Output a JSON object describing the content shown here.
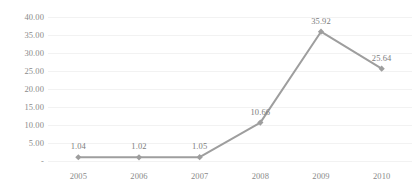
{
  "chart_data": {
    "type": "line",
    "title": "",
    "subtitle": "",
    "xlabel": "",
    "ylabel": "",
    "categories": [
      "2005",
      "2006",
      "2007",
      "2008",
      "2009",
      "2010"
    ],
    "values": [
      1.04,
      1.02,
      1.05,
      10.66,
      35.92,
      25.64
    ],
    "point_labels": [
      "1.04",
      "1.02",
      "1.05",
      "10.66",
      "35.92",
      "25.64"
    ],
    "series": [
      {
        "name": "",
        "values": [
          1.04,
          1.02,
          1.05,
          10.66,
          35.92,
          25.64
        ]
      }
    ],
    "ylim": [
      0,
      40
    ],
    "y_ticks": [
      40,
      35,
      30,
      25,
      20,
      15,
      10,
      5,
      0
    ],
    "y_tick_labels": [
      "40.00",
      "35.00",
      "30.00",
      "25.00",
      "20.00",
      "15.00",
      "10.00",
      "5.00",
      "-"
    ],
    "x_tick_labels": [
      "2005",
      "2006",
      "2007",
      "2008",
      "2009",
      "2010"
    ],
    "grid": true,
    "grid_axis": "y",
    "legend": false,
    "legend_position": "none",
    "marker": "diamond",
    "colors": {
      "line": "#9e9e9e",
      "marker": "#9e9e9e",
      "grid": "#f2f2f2",
      "tick_label": "#8a8a8a",
      "point_label": "#7d7d7d",
      "background": "#ffffff"
    }
  }
}
